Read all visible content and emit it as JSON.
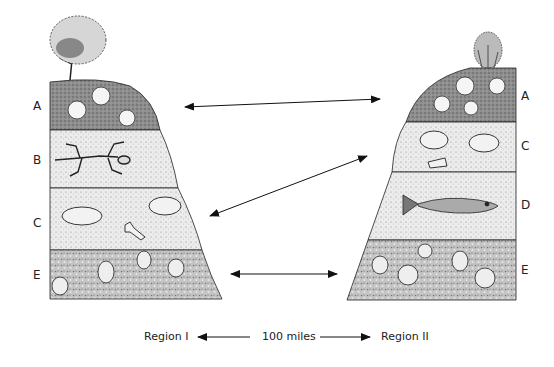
{
  "diagram": {
    "type": "rock-strata-correlation",
    "region_1": {
      "name": "Region I",
      "layers": [
        {
          "label": "A",
          "fossil": "sand dollars / sea urchins",
          "texture": "dark coarse"
        },
        {
          "label": "B",
          "fossil": "reptile skeleton",
          "texture": "fine sand"
        },
        {
          "label": "C",
          "fossil": "mammal skulls and bone",
          "texture": "fine sand"
        },
        {
          "label": "E",
          "fossil": "scallop shells",
          "texture": "coarse gravel"
        }
      ],
      "surface": "tree"
    },
    "region_2": {
      "name": "Region II",
      "layers": [
        {
          "label": "A",
          "fossil": "sand dollars / sea urchins",
          "texture": "dark coarse"
        },
        {
          "label": "C",
          "fossil": "mammal skulls and bone",
          "texture": "fine sand"
        },
        {
          "label": "D",
          "fossil": "fish",
          "texture": "fine sand"
        },
        {
          "label": "E",
          "fossil": "scallop shells",
          "texture": "coarse gravel"
        }
      ],
      "surface": "shrub"
    },
    "correlations": [
      {
        "from": "A",
        "to": "A"
      },
      {
        "from": "C",
        "to": "C"
      },
      {
        "from": "E",
        "to": "E"
      }
    ],
    "scale": {
      "left_label": "Region I",
      "distance": "100 miles",
      "right_label": "Region II"
    },
    "colors": {
      "ink": "#222222",
      "layer_dark": "#8a8a8a",
      "layer_light": "#e2e2e2",
      "layer_gravel": "#b8b8b8"
    }
  }
}
